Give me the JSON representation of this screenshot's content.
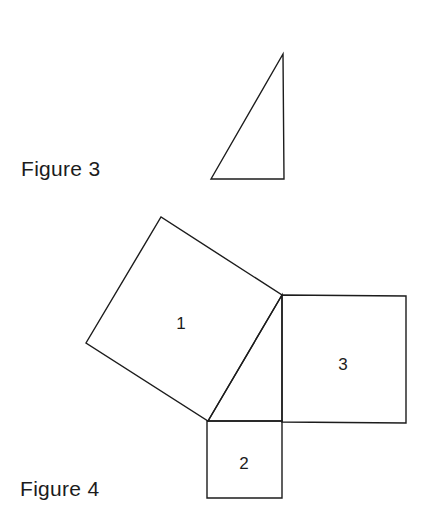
{
  "figures": [
    {
      "id": "figure-3",
      "caption": "Figure 3",
      "shape": "right-triangle",
      "vertices": [
        [
          211,
          179
        ],
        [
          283,
          54
        ],
        [
          284,
          179
        ]
      ]
    },
    {
      "id": "figure-4",
      "caption": "Figure 4",
      "triangle": [
        [
          208,
          421
        ],
        [
          282,
          295
        ],
        [
          282,
          421
        ]
      ],
      "squares": [
        {
          "label": "1",
          "vertices": [
            [
              282,
              295
            ],
            [
              208,
              421
            ],
            [
              86,
              343
            ],
            [
              161,
              217
            ]
          ],
          "label_pos": [
            181,
            329
          ]
        },
        {
          "label": "2",
          "vertices": [
            [
              207,
              421
            ],
            [
              282,
              421
            ],
            [
              282,
              498
            ],
            [
              207,
              498
            ]
          ],
          "label_pos": [
            244,
            469
          ]
        },
        {
          "label": "3",
          "vertices": [
            [
              282,
              295
            ],
            [
              406,
              296
            ],
            [
              406,
              423
            ],
            [
              282,
              422
            ]
          ],
          "label_pos": [
            343,
            370
          ]
        }
      ]
    }
  ],
  "colors": {
    "stroke": "#1c1c1c",
    "background": "#ffffff"
  }
}
